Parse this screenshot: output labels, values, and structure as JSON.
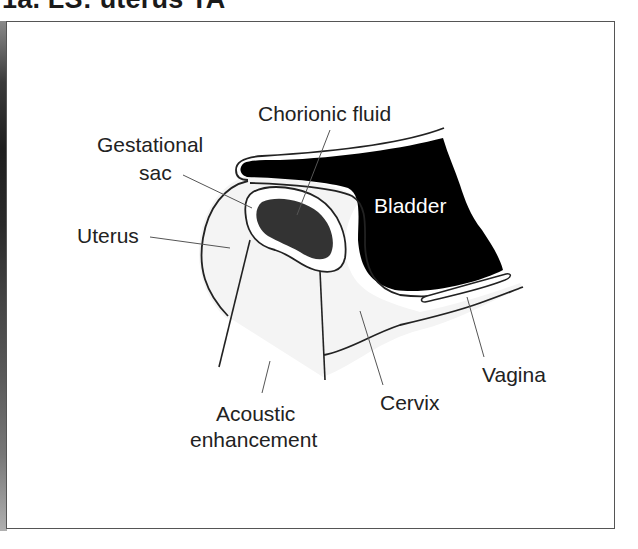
{
  "title": "1a. LS: uterus TA",
  "colors": {
    "outline": "#222222",
    "tissue_fill": "#f4f4f4",
    "fluid_fill": "#333333",
    "bladder_fill": "#000000",
    "leader_line": "#555555",
    "frame_border": "#555555"
  },
  "labels": {
    "chorionic_fluid": "Chorionic fluid",
    "gestational_sac_line1": "Gestational",
    "gestational_sac_line2": "sac",
    "uterus": "Uterus",
    "bladder": "Bladder",
    "vagina": "Vagina",
    "cervix": "Cervix",
    "acoustic_line1": "Acoustic",
    "acoustic_line2": "enhancement"
  }
}
